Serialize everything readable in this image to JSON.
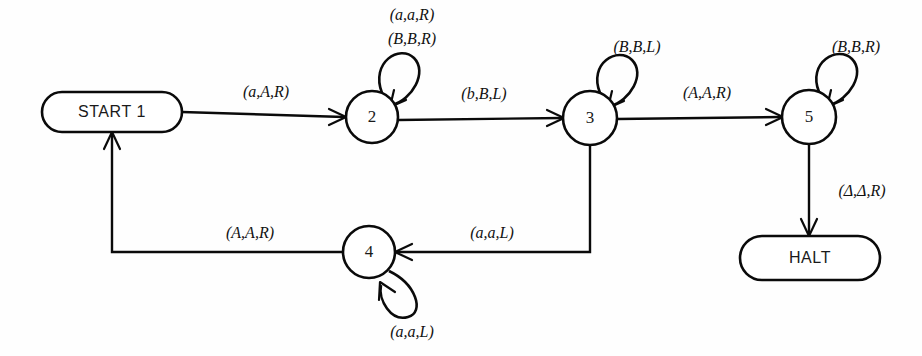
{
  "diagram": {
    "type": "state-machine",
    "background_color": "#fefefe",
    "stroke_color": "#0a0a0a",
    "nodes": [
      {
        "id": "start1",
        "label": "START 1",
        "shape": "stadium",
        "cx": 112,
        "cy": 112,
        "rx": 70,
        "ry": 20
      },
      {
        "id": "s2",
        "label": "2",
        "shape": "circle",
        "cx": 372,
        "cy": 117,
        "r": 26
      },
      {
        "id": "s3",
        "label": "3",
        "shape": "circle",
        "cx": 590,
        "cy": 118,
        "r": 27
      },
      {
        "id": "s5",
        "label": "5",
        "shape": "circle",
        "cx": 809,
        "cy": 117,
        "r": 27
      },
      {
        "id": "s4",
        "label": "4",
        "shape": "circle",
        "cx": 369,
        "cy": 252,
        "r": 26
      },
      {
        "id": "halt",
        "label": "HALT",
        "shape": "stadium",
        "cx": 810,
        "cy": 258,
        "rx": 70,
        "ry": 22
      }
    ],
    "edges": [
      {
        "id": "e-start-2",
        "from": "start1",
        "to": "s2",
        "label": "(a,A,R)",
        "label_x": 266,
        "label_y": 93
      },
      {
        "id": "e-2-3",
        "from": "s2",
        "to": "s3",
        "label": "(b,B,L)",
        "label_x": 484,
        "label_y": 95
      },
      {
        "id": "e-3-5",
        "from": "s3",
        "to": "s5",
        "label": "(A,A,R)",
        "label_x": 707,
        "label_y": 94
      },
      {
        "id": "e-5-halt",
        "from": "s5",
        "to": "halt",
        "label": "(Δ,Δ,R)",
        "label_x": 862,
        "label_y": 192
      },
      {
        "id": "e-3-4",
        "from": "s3",
        "to": "s4",
        "label": "(a,a,L)",
        "label_x": 492,
        "label_y": 234
      },
      {
        "id": "e-4-start",
        "from": "s4",
        "to": "start1",
        "label": "(A,A,R)",
        "label_x": 250,
        "label_y": 234
      }
    ],
    "self_loops": [
      {
        "id": "loop-2",
        "node": "s2",
        "labels": [
          "(a,a,R)",
          "(B,B,R)"
        ],
        "label_x": 412,
        "label_y": 16,
        "label_line_height": 22
      },
      {
        "id": "loop-3",
        "node": "s3",
        "labels": [
          "(B,B,L)"
        ],
        "label_x": 637,
        "label_y": 48,
        "label_line_height": 22
      },
      {
        "id": "loop-5",
        "node": "s5",
        "labels": [
          "(B,B,R)"
        ],
        "label_x": 856,
        "label_y": 48,
        "label_line_height": 22
      },
      {
        "id": "loop-4",
        "node": "s4",
        "labels": [
          "(a,a,L)"
        ],
        "label_x": 412,
        "label_y": 333,
        "label_line_height": 22
      }
    ]
  }
}
